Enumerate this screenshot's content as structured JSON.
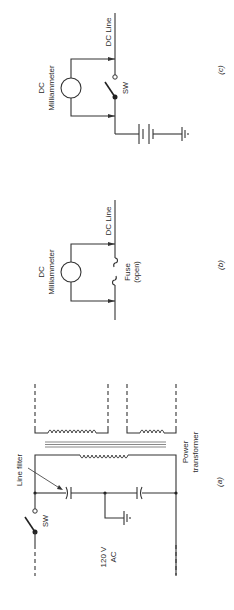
{
  "figure": {
    "panels": [
      {
        "id": "a",
        "caption": "(a)",
        "labels": {
          "line_filter": "Line filter",
          "switch": "SW",
          "source_line1": "120 V",
          "source_line2": "AC",
          "transformer_line1": "Power",
          "transformer_line2": "transformer"
        },
        "components": [
          "switch",
          "line-filter-capacitor",
          "capacitor",
          "ground",
          "power-transformer-primary",
          "secondary-winding-1",
          "secondary-winding-2"
        ]
      },
      {
        "id": "b",
        "caption": "(b)",
        "labels": {
          "meter_line1": "DC",
          "meter_line2": "Milliammeter",
          "line": "DC Line",
          "fuse_line1": "Fuse",
          "fuse_line2": "(open)"
        },
        "components": [
          "milliammeter",
          "open-fuse"
        ]
      },
      {
        "id": "c",
        "caption": "(c)",
        "labels": {
          "meter_line1": "DC",
          "meter_line2": "Milliammeter",
          "line": "DC Line",
          "switch": "SW"
        },
        "components": [
          "milliammeter",
          "switch",
          "battery",
          "ground"
        ]
      }
    ],
    "orientation": "rotated-90-ccw"
  }
}
